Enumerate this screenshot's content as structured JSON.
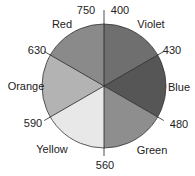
{
  "diagram": {
    "type": "color-wheel",
    "center": [
      104,
      86
    ],
    "radius": 62,
    "sectors": [
      {
        "name": "Violet",
        "from": 400,
        "to": 430,
        "start_deg": -90,
        "end_deg": -30,
        "fill": "#6f6f6f"
      },
      {
        "name": "Blue",
        "from": 430,
        "to": 480,
        "start_deg": -30,
        "end_deg": 30,
        "fill": "#565656"
      },
      {
        "name": "Green",
        "from": 480,
        "to": 560,
        "start_deg": 30,
        "end_deg": 90,
        "fill": "#8e8e8e"
      },
      {
        "name": "Yellow",
        "from": 560,
        "to": 590,
        "start_deg": 90,
        "end_deg": 150,
        "fill": "#e8e8e8"
      },
      {
        "name": "Orange",
        "from": 590,
        "to": 630,
        "start_deg": 150,
        "end_deg": 210,
        "fill": "#b3b3b3"
      },
      {
        "name": "Red",
        "from": 630,
        "to": 750,
        "start_deg": 210,
        "end_deg": 270,
        "fill": "#8a8a8a"
      }
    ],
    "boundary_labels": [
      {
        "text": "750",
        "x": 86,
        "y": 14,
        "anchor": "middle"
      },
      {
        "text": "400",
        "x": 120,
        "y": 14,
        "anchor": "middle"
      },
      {
        "text": "430",
        "x": 172,
        "y": 54,
        "anchor": "middle"
      },
      {
        "text": "480",
        "x": 179,
        "y": 128,
        "anchor": "middle"
      },
      {
        "text": "560",
        "x": 105,
        "y": 169,
        "anchor": "middle"
      },
      {
        "text": "590",
        "x": 33,
        "y": 127,
        "anchor": "middle"
      },
      {
        "text": "630",
        "x": 37,
        "y": 54,
        "anchor": "middle"
      }
    ],
    "sector_labels": [
      {
        "text": "Violet",
        "x": 151,
        "y": 28
      },
      {
        "text": "Blue",
        "x": 179,
        "y": 91
      },
      {
        "text": "Green",
        "x": 152,
        "y": 154
      },
      {
        "text": "Yellow",
        "x": 52,
        "y": 153
      },
      {
        "text": "Orange",
        "x": 26,
        "y": 90
      },
      {
        "text": "Red",
        "x": 62,
        "y": 28
      }
    ]
  }
}
